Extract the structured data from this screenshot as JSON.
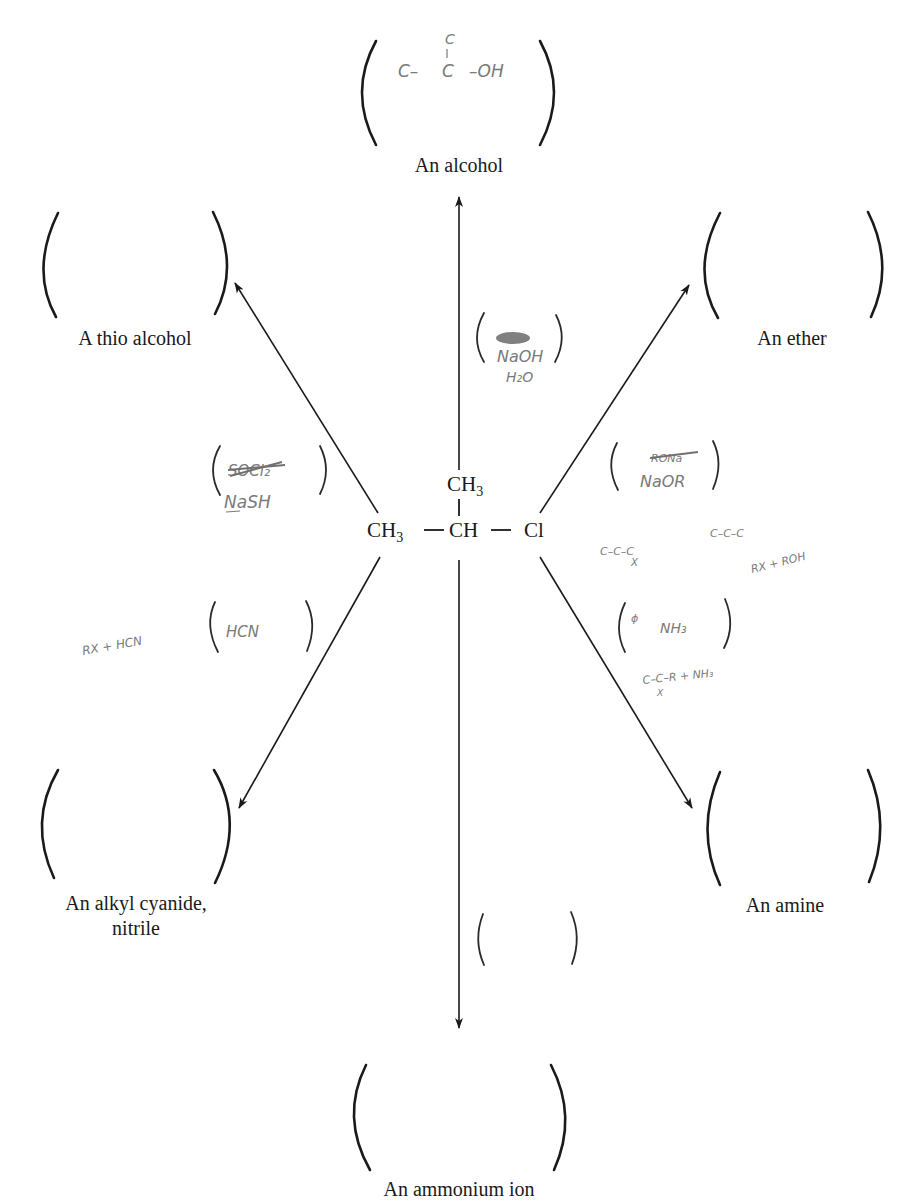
{
  "diagram": {
    "center_molecule": {
      "main_chain": [
        {
          "base": "CH",
          "sub": "3"
        },
        {
          "base": "CH",
          "sub": ""
        },
        {
          "base": "Cl",
          "sub": ""
        }
      ],
      "bond": "—",
      "branch": {
        "base": "CH",
        "sub": "3"
      }
    },
    "products": [
      {
        "id": "alcohol",
        "label": "An alcohol",
        "handwritten_answer": "C–C(–C)–OH",
        "direction": "up"
      },
      {
        "id": "thio-alcohol",
        "label": "A thio alcohol",
        "handwritten_answer": "",
        "direction": "up-left"
      },
      {
        "id": "ether",
        "label": "An ether",
        "handwritten_answer": "",
        "direction": "up-right"
      },
      {
        "id": "alkyl-cyanide",
        "label_line1": "An alkyl cyanide,",
        "label_line2": "nitrile",
        "handwritten_answer": "",
        "direction": "down-left"
      },
      {
        "id": "amine",
        "label": "An amine",
        "handwritten_answer": "",
        "direction": "down-right"
      },
      {
        "id": "ammonium-ion",
        "label": "An ammonium ion",
        "handwritten_answer": "",
        "direction": "down"
      }
    ],
    "reagents": [
      {
        "id": "alcohol-reagent",
        "crossed_out": "KOH",
        "lines": [
          "NaOH",
          "H₂O"
        ]
      },
      {
        "id": "thio-reagent",
        "crossed_out": "SOCl₂",
        "lines": [
          "NaSH"
        ]
      },
      {
        "id": "ether-reagent",
        "crossed_out": "RONa",
        "lines": [
          "NaOR"
        ]
      },
      {
        "id": "cyanide-reagent",
        "crossed_out": "",
        "lines": [
          "HCN"
        ]
      },
      {
        "id": "amine-reagent",
        "crossed_out": "",
        "lines": [
          "NH₃"
        ]
      },
      {
        "id": "ammonium-reagent",
        "crossed_out": "",
        "lines": []
      }
    ],
    "notes": {
      "cyanide_note": "RX + HCN",
      "ether_note_1": "C–C–C",
      "ether_note_1_sub": "X",
      "ether_note_2": "C–C–C",
      "ether_note_2b": "RX + ROH",
      "amine_note": "C–C–R + NH₃",
      "amine_note_sub": "X"
    },
    "alcohol_answer": {
      "top": "C",
      "left": "C–",
      "center": "C",
      "right": "–OH"
    },
    "colors": {
      "ink": "#1a1a1a",
      "pencil": "#7a7a7a"
    }
  }
}
